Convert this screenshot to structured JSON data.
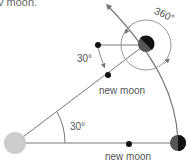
{
  "caption_fragment": "v moon.",
  "labels": {
    "angle_top": "30°",
    "angle_bottom": "30°",
    "rotation": "360°",
    "new_moon_top": "new moon",
    "new_moon_bottom": "new moon"
  },
  "bodies": {
    "sun": {
      "name": "Sun",
      "color": "#cccccc"
    },
    "earth": {
      "name": "Earth",
      "dark": "#111111",
      "shade": "#555555"
    },
    "moon": {
      "name": "Moon",
      "color": "#111111"
    }
  },
  "colors": {
    "line": "#666666",
    "arrow": "#777777",
    "ring": "#999999",
    "text": "#555555"
  }
}
